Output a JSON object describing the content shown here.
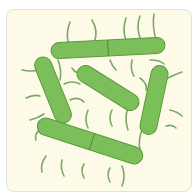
{
  "image": {
    "subject": "rod-shaped bacteria with flagella illustration",
    "background_color": "#fdfbe8",
    "border_color": "#dde3e6",
    "cell_fill": "#7cbf5a",
    "cell_stroke": "#5a9a3c",
    "flagella_color": "#7aa86a",
    "cells": [
      {
        "cx": 108,
        "cy": 48,
        "len": 115,
        "w": 16,
        "angle": -3,
        "septum": true
      },
      {
        "cx": 53,
        "cy": 90,
        "len": 70,
        "w": 17,
        "angle": 68,
        "septum": false
      },
      {
        "cx": 108,
        "cy": 88,
        "len": 70,
        "w": 17,
        "angle": 32,
        "septum": false
      },
      {
        "cx": 154,
        "cy": 100,
        "len": 70,
        "w": 17,
        "angle": -78,
        "septum": false
      },
      {
        "cx": 90,
        "cy": 141,
        "len": 110,
        "w": 17,
        "angle": 18,
        "septum": true
      }
    ]
  }
}
